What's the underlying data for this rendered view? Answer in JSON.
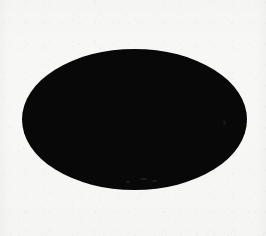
{
  "figure": {
    "title": "Solid black ellipse on light paper background",
    "caption": "",
    "medium": "scanned-image",
    "canvas": {
      "width_px": 266,
      "height_px": 236,
      "background_color": "#f7f7f6"
    },
    "shapes": [
      {
        "name": "ellipse",
        "type": "ellipse",
        "fill_color": "#080808",
        "stroke": "none",
        "center_x_px": 134,
        "center_y_px": 119,
        "width_px": 225,
        "height_px": 141,
        "semi_major_axis_px": 112,
        "semi_minor_axis_px": 70,
        "left_px": 22,
        "top_px": 49,
        "right_px": 247,
        "bottom_px": 190,
        "rotation_deg": 0
      }
    ],
    "artifacts": {
      "grain_label": "paper-grain",
      "speck_label": "scan-speck",
      "band_left_label": "scan-band-left",
      "band_right_label": "scan-band-right"
    }
  }
}
